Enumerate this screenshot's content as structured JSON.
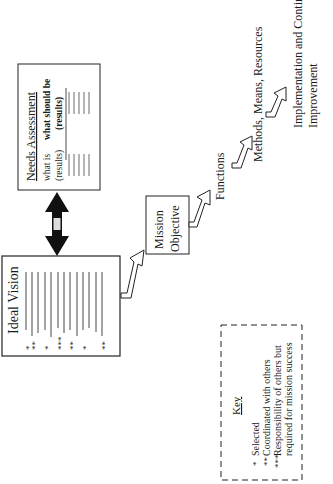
{
  "diagram": {
    "orientation": "rotated 90 degrees counter-clockwise",
    "ideal_vision": {
      "title": "Ideal Vision",
      "rows": [
        "*",
        "**",
        "*",
        "***",
        "**",
        "*",
        "",
        "**"
      ]
    },
    "needs_assessment": {
      "title": "Needs Assessment",
      "col1": "what is",
      "col1_sub": "(results)",
      "col2": "what should be",
      "col2_sub": "(results)"
    },
    "mission_objective": {
      "line1": "Mission",
      "line2": "Objective"
    },
    "steps": {
      "functions": "Functions",
      "methods": "Methods, Means, Resources",
      "implementation_line1": "Implementation and Continuous",
      "implementation_line2": "Improvement"
    },
    "key": {
      "title": "Key",
      "items": [
        {
          "symbol": "*",
          "label": "Selected"
        },
        {
          "symbol": "**",
          "label": "Coordinated with others"
        },
        {
          "symbol": "***",
          "label": "Responsibility of others but"
        }
      ],
      "continuation": "required for mission success"
    }
  }
}
